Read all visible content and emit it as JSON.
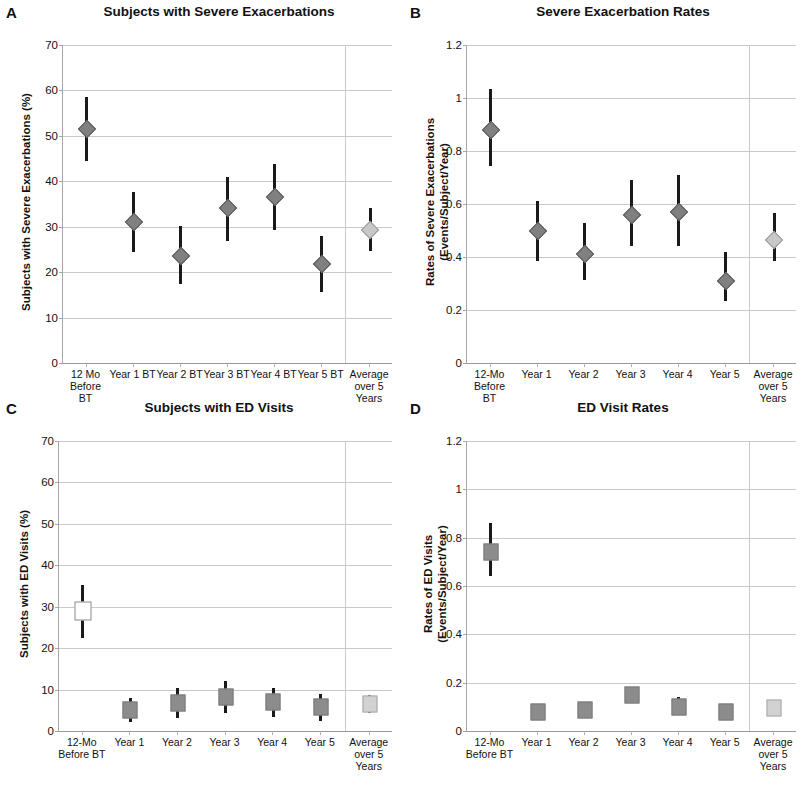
{
  "figure": {
    "panels": [
      "A",
      "B",
      "C",
      "D"
    ]
  },
  "panelA": {
    "letter": "A",
    "title": "Subjects with Severe Exacerbations",
    "ylabel": "Subjects with Severe Exacerbations (%)",
    "yticks": [
      "0",
      "10",
      "20",
      "30",
      "40",
      "50",
      "60",
      "70"
    ],
    "xticklabels": [
      "12 Mo\nBefore\nBT",
      "Year 1 BT",
      "Year 2 BT",
      "Year 3 BT",
      "Year 4 BT",
      "Year 5 BT",
      "Average\nover 5\nYears"
    ]
  },
  "panelB": {
    "letter": "B",
    "title": "Severe Exacerbation Rates",
    "ylabel_line1": "Rates of Severe Exacerbations",
    "ylabel_line2": "(Events/Subject/Year)",
    "yticks": [
      "0",
      "0.2",
      "0.4",
      "0.6",
      "0.8",
      "1",
      "1.2"
    ],
    "xticklabels": [
      "12-Mo\nBefore\nBT",
      "Year 1",
      "Year 2",
      "Year 3",
      "Year 4",
      "Year 5",
      "Average\nover 5\nYears"
    ]
  },
  "panelC": {
    "letter": "C",
    "title": "Subjects with ED Visits",
    "ylabel": "Subjects with ED Visits (%)",
    "yticks": [
      "0",
      "10",
      "20",
      "30",
      "40",
      "50",
      "60",
      "70"
    ],
    "xticklabels": [
      "12-Mo\nBefore BT",
      "Year 1",
      "Year 2",
      "Year 3",
      "Year 4",
      "Year 5",
      "Average\nover 5\nYears"
    ]
  },
  "panelD": {
    "letter": "D",
    "title": "ED Visit Rates",
    "ylabel_line1": "Rates of ED Visits",
    "ylabel_line2": "(Events/Subject/Year)",
    "yticks": [
      "0",
      "0.2",
      "0.4",
      "0.6",
      "0.8",
      "1",
      "1.2"
    ],
    "xticklabels": [
      "12-Mo\nBefore BT",
      "Year 1",
      "Year 2",
      "Year 3",
      "Year 4",
      "Year 5",
      "Average\nover 5\nYears"
    ]
  },
  "chart_data": [
    {
      "panel": "A",
      "type": "scatter",
      "title": "Subjects with Severe Exacerbations",
      "xlabel": "",
      "ylabel": "Subjects with Severe Exacerbations (%)",
      "ylim": [
        0,
        70
      ],
      "ytick_step": 10,
      "grid": true,
      "marker": "diamond",
      "categories": [
        "12 Mo Before BT",
        "Year 1 BT",
        "Year 2 BT",
        "Year 3 BT",
        "Year 4 BT",
        "Year 5 BT",
        "Average over 5 Years"
      ],
      "values": [
        51.5,
        31.0,
        23.6,
        34.1,
        36.5,
        21.7,
        29.2
      ],
      "ci_low": [
        44.4,
        24.4,
        17.4,
        26.9,
        29.2,
        15.6,
        24.6
      ],
      "ci_high": [
        58.6,
        37.6,
        30.2,
        41.0,
        43.8,
        28.0,
        34.1
      ],
      "highlight_last": true
    },
    {
      "panel": "B",
      "type": "scatter",
      "title": "Severe Exacerbation Rates",
      "xlabel": "",
      "ylabel": "Rates of Severe Exacerbations (Events/Subject/Year)",
      "ylim": [
        0,
        1.2
      ],
      "ytick_step": 0.2,
      "grid": true,
      "marker": "diamond",
      "categories": [
        "12-Mo Before BT",
        "Year 1",
        "Year 2",
        "Year 3",
        "Year 4",
        "Year 5",
        "Average over 5 Years"
      ],
      "values": [
        0.88,
        0.5,
        0.41,
        0.56,
        0.57,
        0.31,
        0.465
      ],
      "ci_low": [
        0.745,
        0.385,
        0.315,
        0.44,
        0.44,
        0.235,
        0.385
      ],
      "ci_high": [
        1.035,
        0.61,
        0.53,
        0.69,
        0.71,
        0.42,
        0.565
      ],
      "highlight_last": true
    },
    {
      "panel": "C",
      "type": "scatter",
      "title": "Subjects with ED Visits",
      "xlabel": "",
      "ylabel": "Subjects with ED Visits (%)",
      "ylim": [
        0,
        70
      ],
      "ytick_step": 10,
      "grid": true,
      "marker": "square",
      "categories": [
        "12-Mo Before BT",
        "Year 1",
        "Year 2",
        "Year 3",
        "Year 4",
        "Year 5",
        "Average over 5 Years"
      ],
      "values": [
        29.0,
        5.1,
        6.8,
        8.3,
        6.9,
        5.8,
        6.5
      ],
      "ci_low": [
        22.5,
        2.2,
        3.2,
        4.3,
        3.5,
        2.3,
        4.4
      ],
      "ci_high": [
        35.3,
        8.0,
        10.4,
        12.1,
        10.5,
        9.0,
        8.8
      ],
      "highlight_last": true,
      "first_marker_open": true
    },
    {
      "panel": "D",
      "type": "scatter",
      "title": "ED Visit Rates",
      "xlabel": "",
      "ylabel": "Rates of ED Visits (Events/Subject/Year)",
      "ylim": [
        0,
        1.2
      ],
      "ytick_step": 0.2,
      "grid": true,
      "marker": "square",
      "categories": [
        "12-Mo Before BT",
        "Year 1",
        "Year 2",
        "Year 3",
        "Year 4",
        "Year 5",
        "Average over 5 Years"
      ],
      "values": [
        0.74,
        0.08,
        0.085,
        0.147,
        0.1,
        0.08,
        0.095
      ],
      "ci_low": [
        0.64,
        0.055,
        0.06,
        0.118,
        0.07,
        0.057,
        0.07
      ],
      "ci_high": [
        0.86,
        0.105,
        0.115,
        0.178,
        0.14,
        0.1,
        0.125
      ],
      "highlight_last": true
    }
  ],
  "colors": {
    "marker_fill": "#808080",
    "marker_fill_light": "#c8c8c8",
    "errorbar": "#1a1a1a",
    "gridline": "#c9c9c9",
    "axis": "#a6a6a6",
    "text": "#111111"
  }
}
